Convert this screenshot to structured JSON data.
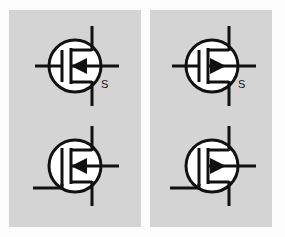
{
  "figure": {
    "background_color": "#fcfcfc",
    "panel_color": "#d4d4d4",
    "line_color": "#111111"
  },
  "panels": [
    {
      "id": "left",
      "name": "left-panel",
      "symbols": [
        {
          "id": "left-top",
          "name": "mosfet-symbol-left-top",
          "type": "mosfet",
          "arrow_direction": "left",
          "arrow_position": "middle",
          "source_lead": "bottom",
          "gate_lead": "left",
          "drain_lead": "top",
          "body_lead": "right",
          "label": "S",
          "label_visible": true
        },
        {
          "id": "left-bottom",
          "name": "mosfet-symbol-left-bottom",
          "type": "mosfet",
          "arrow_direction": "left",
          "arrow_position": "middle",
          "source_lead": "bottom",
          "gate_lead": "lower-left",
          "drain_lead": "top",
          "body_lead": "right",
          "label": "",
          "label_visible": false
        }
      ]
    },
    {
      "id": "right",
      "name": "right-panel",
      "symbols": [
        {
          "id": "right-top",
          "name": "mosfet-symbol-right-top",
          "type": "mosfet",
          "arrow_direction": "right",
          "arrow_position": "middle",
          "source_lead": "bottom",
          "gate_lead": "left",
          "drain_lead": "top",
          "body_lead": "right",
          "label": "S",
          "label_visible": true
        },
        {
          "id": "right-bottom",
          "name": "mosfet-symbol-right-bottom",
          "type": "mosfet",
          "arrow_direction": "right",
          "arrow_position": "middle",
          "source_lead": "bottom",
          "gate_lead": "lower-left",
          "drain_lead": "top",
          "body_lead": "right",
          "label": "",
          "label_visible": false
        }
      ]
    }
  ],
  "labels": {
    "left_top_source": "S",
    "right_top_source": "S"
  }
}
